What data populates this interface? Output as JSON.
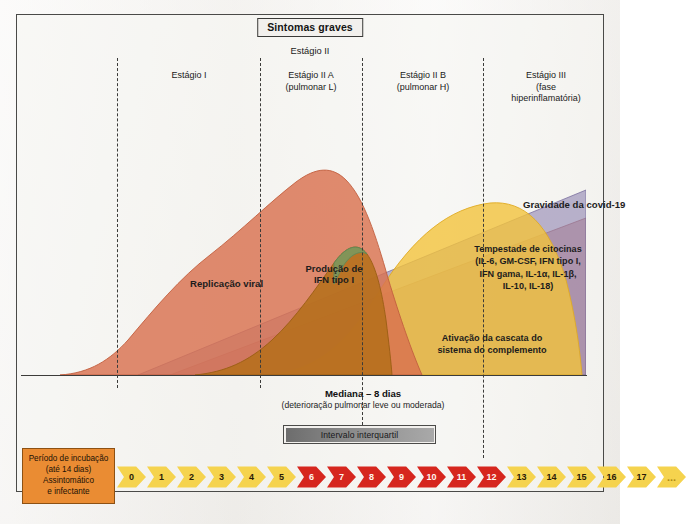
{
  "title_box": "Sintomas graves",
  "estagio2_label": "Estágio II",
  "stages": [
    {
      "name": "Estágio I",
      "sub": ""
    },
    {
      "name": "Estágio II A",
      "sub": "(pulmonar L)"
    },
    {
      "name": "Estágio II B",
      "sub": "(pulmonar H)"
    },
    {
      "name": "Estágio III",
      "sub": "(fase hiperinflamatória)"
    }
  ],
  "curve_labels": {
    "viral": "Replicação viral",
    "ifn": [
      "Produção de",
      "IFN tipo I"
    ],
    "severity": "Gravidade da covid-19",
    "cytokine": [
      "Tempestade de citocinas",
      "(IL-6, GM-CSF, IFN tipo I,",
      "IFN gama, IL-1α, IL-1β,",
      "IL-10, IL-18)"
    ],
    "complement": [
      "Ativação da cascata do",
      "sistema do complemento"
    ]
  },
  "median": {
    "line1": "Mediana – 8 dias",
    "line2": "(deterioração pulmonar leve ou moderada)"
  },
  "iqr_label": "Intervalo interquartil",
  "incubation": [
    "Período de incubação",
    "(até 14 dias)",
    "Assintomático",
    "e infectante"
  ],
  "days": [
    "0",
    "1",
    "2",
    "3",
    "4",
    "5",
    "6",
    "7",
    "8",
    "9",
    "10",
    "11",
    "12",
    "13",
    "14",
    "15",
    "16",
    "17",
    "..."
  ],
  "day_colors": [
    "y",
    "y",
    "y",
    "y",
    "y",
    "y",
    "r",
    "r",
    "r",
    "r",
    "r",
    "r",
    "r",
    "y",
    "y",
    "y",
    "y",
    "y",
    "y"
  ],
  "colors": {
    "viral": "#d9724f",
    "ifn": "#b5701b",
    "cytokine": "#f2c33c",
    "severity": "#8b7fae",
    "complement": "#c98a86",
    "arrow_yellow": "#f5d34e",
    "arrow_red": "#d6261e",
    "incubation_box": "#ea8c33"
  },
  "chart_data": {
    "type": "area",
    "xlabel": "Dias",
    "ylabel": "Intensidade relativa",
    "x": [
      0,
      1,
      2,
      3,
      4,
      5,
      6,
      7,
      8,
      9,
      10,
      11,
      12,
      13,
      14,
      15,
      16,
      17,
      18
    ],
    "xlim": [
      0,
      18
    ],
    "ylim": [
      0,
      100
    ],
    "grid": false,
    "legend": "inline-annotations",
    "stage_boundaries_days": [
      1.5,
      6.0,
      9.5,
      13.5
    ],
    "median_day": 8,
    "iqr_days": [
      6,
      12
    ],
    "series": [
      {
        "name": "Replicação viral",
        "color": "#d9724f",
        "values": [
          2,
          6,
          14,
          28,
          44,
          58,
          72,
          85,
          92,
          86,
          70,
          52,
          36,
          24,
          15,
          9,
          5,
          3,
          1
        ]
      },
      {
        "name": "Produção de IFN tipo I",
        "color": "#b5701b",
        "values": [
          0,
          1,
          2,
          4,
          8,
          16,
          30,
          50,
          66,
          60,
          44,
          30,
          19,
          11,
          6,
          3,
          1,
          0,
          0
        ]
      },
      {
        "name": "Tempestade de citocinas",
        "color": "#f2c33c",
        "values": [
          0,
          0,
          0,
          1,
          2,
          4,
          8,
          16,
          28,
          42,
          56,
          68,
          76,
          80,
          78,
          70,
          58,
          44,
          30
        ]
      },
      {
        "name": "Gravidade da covid-19",
        "color": "#8b7fae",
        "values": [
          0,
          1,
          2,
          4,
          7,
          11,
          16,
          22,
          29,
          37,
          45,
          53,
          61,
          68,
          74,
          79,
          83,
          86,
          88
        ]
      },
      {
        "name": "Ativação da cascata do sistema do complemento",
        "color": "#c98a86",
        "values": [
          0,
          0,
          1,
          2,
          3,
          5,
          8,
          12,
          17,
          23,
          29,
          35,
          40,
          44,
          47,
          49,
          50,
          50,
          49
        ]
      }
    ]
  }
}
